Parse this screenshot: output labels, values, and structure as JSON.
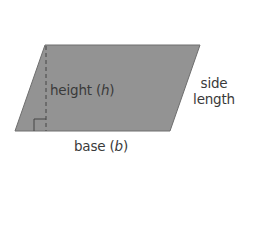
{
  "diagram": {
    "shape": {
      "type": "parallelogram",
      "vertices": [
        [
          45,
          45
        ],
        [
          200,
          45
        ],
        [
          170,
          131
        ],
        [
          15,
          131
        ]
      ],
      "fill": "#939393",
      "stroke": "#6e6e6e"
    },
    "height_line": {
      "x": 46,
      "y1": 45,
      "y2": 131,
      "style": "dashed",
      "color": "#444444"
    },
    "right_angle_marker": {
      "x": 34,
      "y": 119,
      "size": 12
    },
    "labels": {
      "height": {
        "prefix": "height (",
        "var": "h",
        "suffix": ")"
      },
      "base": {
        "prefix": "base (",
        "var": "b",
        "suffix": ")"
      },
      "side_line1": "side",
      "side_line2": "length"
    },
    "text_color": "#3a3a3a"
  }
}
